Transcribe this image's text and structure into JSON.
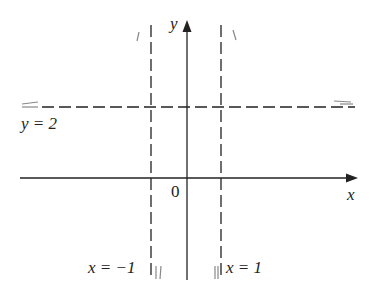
{
  "diagram": {
    "type": "coordinate-graph-asymptotes",
    "axes": {
      "x_label": "x",
      "y_label": "y",
      "origin_label": "0"
    },
    "asymptotes": {
      "horizontal": {
        "label": "y = 2",
        "value": 2
      },
      "vertical_left": {
        "label": "x = −1",
        "value": -1
      },
      "vertical_right": {
        "label": "x = 1",
        "value": 1
      }
    },
    "colors": {
      "axis": "#222222",
      "asymptote": "#222222",
      "curve_hint": "#888888"
    }
  }
}
